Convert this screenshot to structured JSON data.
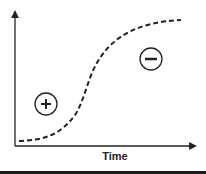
{
  "diagram": {
    "x_axis_label": "Time",
    "y_axis_label": "",
    "curve": {
      "type": "sigmoid",
      "style": "dashed",
      "color": "#222222"
    },
    "regions": [
      {
        "symbol": "+",
        "icon": "plus-circle-icon",
        "position": "below-left of curve"
      },
      {
        "symbol": "−",
        "icon": "minus-circle-icon",
        "position": "above-right of curve"
      }
    ]
  }
}
